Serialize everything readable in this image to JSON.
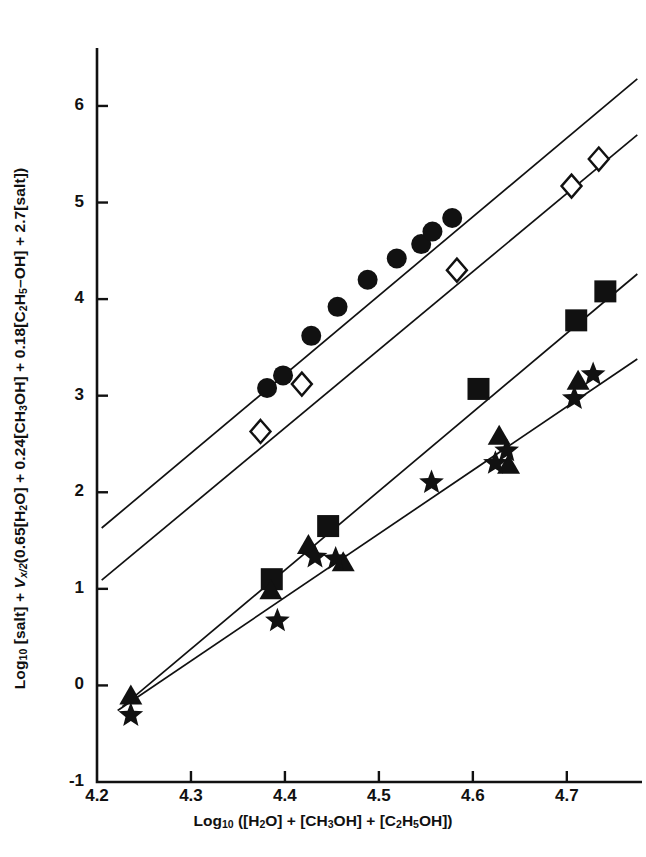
{
  "chart_data": {
    "type": "scatter",
    "title": "",
    "xlabel": "Log10 ([H2O] + [CH3OH] + [C2H5OH])",
    "ylabel": "Log10 [salt] + Vx/2(0.65[H2O] + 0.24[CH3OH] + 0.18[C2H5-OH] + 2.7[salt])",
    "xlim": [
      4.2,
      4.78
    ],
    "ylim": [
      -1,
      6.6
    ],
    "xticks": [
      "4.2",
      "4.3",
      "4.4",
      "4.5",
      "4.6",
      "4.7"
    ],
    "xtick_values": [
      4.2,
      4.3,
      4.4,
      4.5,
      4.6,
      4.7
    ],
    "yticks": [
      "-1",
      "0",
      "1",
      "2",
      "3",
      "4",
      "5",
      "6"
    ],
    "ytick_values": [
      -1,
      0,
      1,
      2,
      3,
      4,
      5,
      6
    ],
    "grid": false,
    "legend": "none",
    "series": [
      {
        "name": "filled-circle",
        "marker": "circle-filled",
        "points": [
          {
            "x": 4.381,
            "y": 3.08
          },
          {
            "x": 4.398,
            "y": 3.21
          },
          {
            "x": 4.428,
            "y": 3.62
          },
          {
            "x": 4.456,
            "y": 3.92
          },
          {
            "x": 4.488,
            "y": 4.2
          },
          {
            "x": 4.519,
            "y": 4.42
          },
          {
            "x": 4.545,
            "y": 4.57
          },
          {
            "x": 4.557,
            "y": 4.7
          },
          {
            "x": 4.578,
            "y": 4.84
          }
        ]
      },
      {
        "name": "open-diamond",
        "marker": "diamond-open",
        "points": [
          {
            "x": 4.374,
            "y": 2.63
          },
          {
            "x": 4.418,
            "y": 3.12
          },
          {
            "x": 4.583,
            "y": 4.3
          },
          {
            "x": 4.705,
            "y": 5.17
          },
          {
            "x": 4.734,
            "y": 5.45
          }
        ]
      },
      {
        "name": "filled-square",
        "marker": "square-filled",
        "points": [
          {
            "x": 4.386,
            "y": 1.1
          },
          {
            "x": 4.446,
            "y": 1.65
          },
          {
            "x": 4.606,
            "y": 3.07
          },
          {
            "x": 4.71,
            "y": 3.78
          },
          {
            "x": 4.741,
            "y": 4.08
          }
        ]
      },
      {
        "name": "filled-triangle",
        "marker": "triangle-filled",
        "points": [
          {
            "x": 4.236,
            "y": -0.11
          },
          {
            "x": 4.385,
            "y": 0.98
          },
          {
            "x": 4.425,
            "y": 1.45
          },
          {
            "x": 4.462,
            "y": 1.27
          },
          {
            "x": 4.628,
            "y": 2.58
          },
          {
            "x": 4.712,
            "y": 3.15
          },
          {
            "x": 4.638,
            "y": 2.28
          }
        ]
      },
      {
        "name": "filled-star",
        "marker": "star-filled",
        "points": [
          {
            "x": 4.236,
            "y": -0.31
          },
          {
            "x": 4.392,
            "y": 0.67
          },
          {
            "x": 4.432,
            "y": 1.33
          },
          {
            "x": 4.454,
            "y": 1.31
          },
          {
            "x": 4.556,
            "y": 2.1
          },
          {
            "x": 4.624,
            "y": 2.3
          },
          {
            "x": 4.636,
            "y": 2.43
          },
          {
            "x": 4.708,
            "y": 2.97
          },
          {
            "x": 4.728,
            "y": 3.22
          }
        ]
      }
    ],
    "fit_lines": [
      {
        "name": "line-circle",
        "x1": 4.205,
        "y1": 1.63,
        "x2": 4.775,
        "y2": 6.28
      },
      {
        "name": "line-diamond",
        "x1": 4.205,
        "y1": 1.09,
        "x2": 4.775,
        "y2": 5.7
      },
      {
        "name": "line-square",
        "x1": 4.227,
        "y1": -0.22,
        "x2": 4.775,
        "y2": 4.26
      },
      {
        "name": "line-star",
        "x1": 4.222,
        "y1": -0.26,
        "x2": 4.775,
        "y2": 3.38
      }
    ]
  },
  "axis": {
    "y_title_parts": {
      "p1": "Log",
      "p1sub": "10",
      "p2": " [salt] + ",
      "p3": "V",
      "p3sub": "x/2",
      "p4": "(0.65[H",
      "p4sub": "2",
      "p5": "O] + 0.24[CH",
      "p5sub": "3",
      "p6": "OH] + 0.18[C",
      "p6sub": "2",
      "p7": "H",
      "p7sub": "5",
      "p8": "–OH] + 2.7[salt])"
    },
    "x_title_parts": {
      "q1": "Log",
      "q1sub": "10",
      "q2": " ([H",
      "q2sub": "2",
      "q3": "O]  +  [CH",
      "q3sub": "3",
      "q4": "OH]  +  [C",
      "q4sub": "2",
      "q5": "H",
      "q5sub": "5",
      "q6": "OH])"
    }
  },
  "colors": {
    "ink": "#111111",
    "background": "#ffffff"
  }
}
